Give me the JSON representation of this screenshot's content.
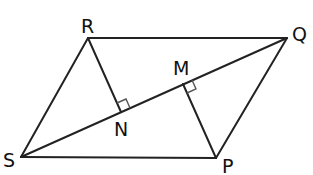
{
  "diagram": {
    "type": "parallelogram-with-perpendiculars",
    "line_color": "#222222",
    "marker_color": "#555555",
    "vertices": {
      "R": {
        "label": "R",
        "x": 88,
        "y": 38
      },
      "Q": {
        "label": "Q",
        "x": 287,
        "y": 38
      },
      "S": {
        "label": "S",
        "x": 21,
        "y": 157
      },
      "P": {
        "label": "P",
        "x": 216,
        "y": 158
      },
      "N": {
        "label": "N",
        "x": 121,
        "y": 112
      },
      "M": {
        "label": "M",
        "x": 183,
        "y": 84
      }
    },
    "segments": [
      "RQ",
      "RS",
      "SP",
      "PQ",
      "SQ",
      "RN",
      "PM"
    ],
    "right_angles": [
      "RNQ",
      "PMS"
    ],
    "labels": {
      "R": "R",
      "Q": "Q",
      "S": "S",
      "P": "P",
      "N": "N",
      "M": "M"
    }
  }
}
